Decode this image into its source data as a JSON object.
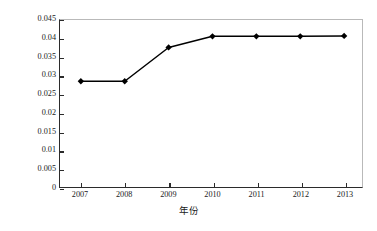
{
  "chart_data": {
    "type": "line",
    "title": "",
    "xlabel": "年份",
    "ylabel": "地均三维量（m³/m²）",
    "ylabel_parts": {
      "prefix": "地均三维量（m",
      "sup1": "3",
      "middle": "/m",
      "sup2": "2",
      "suffix": "）"
    },
    "categories": [
      "2007",
      "2008",
      "2009",
      "2010",
      "2011",
      "2012",
      "2013"
    ],
    "values": [
      0.0285,
      0.0285,
      0.0376,
      0.0406,
      0.0406,
      0.0406,
      0.0407
    ],
    "series": [
      {
        "name": "地均三维量",
        "values": [
          0.0285,
          0.0285,
          0.0376,
          0.0406,
          0.0406,
          0.0406,
          0.0407
        ]
      }
    ],
    "ylim": [
      0,
      0.045
    ],
    "yticks": [
      0,
      0.005,
      0.01,
      0.015,
      0.02,
      0.025,
      0.03,
      0.035,
      0.04,
      0.045
    ],
    "ytick_labels": [
      "0",
      "0.005",
      "0.01",
      "0.015",
      "0.02",
      "0.025",
      "0.03",
      "0.035",
      "0.04",
      "0.045"
    ],
    "xtick_labels": [
      "2007",
      "2008",
      "2009",
      "2010",
      "2011",
      "2012",
      "2013"
    ],
    "grid": false,
    "legend": false,
    "marker": "diamond",
    "line_color": "#000000",
    "marker_color": "#000000",
    "axis_color": "#2b2b2b",
    "background_color": "#ffffff"
  }
}
